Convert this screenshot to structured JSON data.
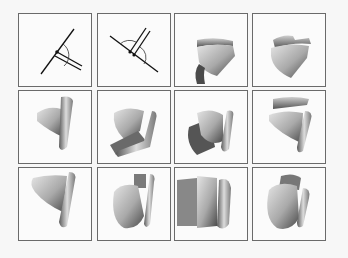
{
  "figure": {
    "layout": {
      "rows": 3,
      "cols": 4
    },
    "colors": {
      "frame": "#6a6a6a",
      "background": "#f7f7f7",
      "line": "#111111"
    },
    "panels": [
      {
        "row": 0,
        "col": 0,
        "kind": "joint-angle-diagram",
        "variant": "obtuse-right"
      },
      {
        "row": 0,
        "col": 1,
        "kind": "joint-angle-diagram",
        "variant": "obtuse-left"
      },
      {
        "row": 0,
        "col": 2,
        "kind": "3d-bone-render",
        "pose": "1"
      },
      {
        "row": 0,
        "col": 3,
        "kind": "3d-bone-render",
        "pose": "2"
      },
      {
        "row": 1,
        "col": 0,
        "kind": "3d-bone-render",
        "pose": "3"
      },
      {
        "row": 1,
        "col": 1,
        "kind": "3d-bone-render",
        "pose": "4"
      },
      {
        "row": 1,
        "col": 2,
        "kind": "3d-bone-render",
        "pose": "5"
      },
      {
        "row": 1,
        "col": 3,
        "kind": "3d-bone-render",
        "pose": "6"
      },
      {
        "row": 2,
        "col": 0,
        "kind": "3d-bone-render",
        "pose": "7"
      },
      {
        "row": 2,
        "col": 1,
        "kind": "3d-bone-render",
        "pose": "8"
      },
      {
        "row": 2,
        "col": 2,
        "kind": "3d-bone-render",
        "pose": "9"
      },
      {
        "row": 2,
        "col": 3,
        "kind": "3d-bone-render",
        "pose": "10"
      }
    ]
  }
}
